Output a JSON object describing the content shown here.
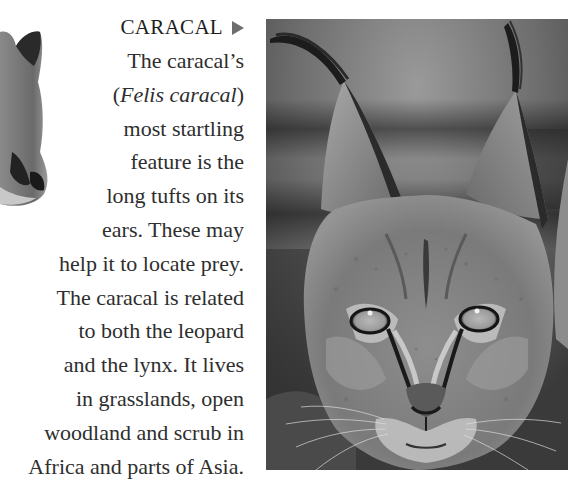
{
  "article": {
    "heading": "CARACAL",
    "heading_arrow_icon": "right-triangle-pointer-icon",
    "body_lines": [
      {
        "before": "The caracal’s",
        "italic": "",
        "after": ""
      },
      {
        "before": "(",
        "italic": "Felis caracal",
        "after": ")"
      },
      {
        "before": "most startling",
        "italic": "",
        "after": ""
      },
      {
        "before": "feature is the",
        "italic": "",
        "after": ""
      },
      {
        "before": "long tufts on its",
        "italic": "",
        "after": ""
      },
      {
        "before": "ears. These may",
        "italic": "",
        "after": ""
      },
      {
        "before": "help it to locate prey.",
        "italic": "",
        "after": ""
      },
      {
        "before": "The caracal is related",
        "italic": "",
        "after": ""
      },
      {
        "before": "to both the leopard",
        "italic": "",
        "after": ""
      },
      {
        "before": "and the lynx. It lives",
        "italic": "",
        "after": ""
      },
      {
        "before": "in grasslands, open",
        "italic": "",
        "after": ""
      },
      {
        "before": "woodland and scrub in",
        "italic": "",
        "after": ""
      },
      {
        "before": "Africa and parts of Asia.",
        "italic": "",
        "after": ""
      }
    ]
  },
  "images": {
    "main_photo": "caracal-face-photo",
    "side_cutout": "cat-face-cutout-partial"
  },
  "colors": {
    "text": "#2e2e2e",
    "arrow": "#6d6d6d",
    "background": "#ffffff"
  }
}
